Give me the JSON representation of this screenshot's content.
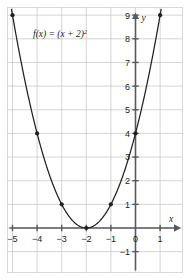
{
  "figure": {
    "background_color": "#ffffff",
    "frame_color": "#d9d9d9",
    "grid_color": "#c9c9c9",
    "axis_color": "#58595b",
    "curve_color": "#231f20",
    "point_color": "#231f20"
  },
  "chart_data": {
    "type": "line",
    "title": "",
    "subtitle": "",
    "xlabel": "x",
    "ylabel": "y",
    "function_label": "f(x) = (x + 2)",
    "function_exponent": "2",
    "equation": "f(x) = (x + 2)^2",
    "xlim": [
      -5.5,
      1.5
    ],
    "ylim": [
      -1.5,
      9.5
    ],
    "xticks": [
      -5,
      -4,
      -3,
      -2,
      -1,
      0,
      1
    ],
    "xtick_labels": [
      "−5",
      "−4",
      "−3",
      "−2",
      "−1",
      "0",
      "1"
    ],
    "yticks": [
      -1,
      1,
      2,
      3,
      4,
      5,
      6,
      7,
      8,
      9
    ],
    "ytick_labels": [
      "−1",
      "1",
      "2",
      "3",
      "4",
      "5",
      "6",
      "7",
      "8",
      "9"
    ],
    "grid": true,
    "legend": "none",
    "series": [
      {
        "name": "f(x) = (x + 2)^2",
        "marked_points": [
          {
            "x": -5,
            "y": 9
          },
          {
            "x": -4,
            "y": 4
          },
          {
            "x": -3,
            "y": 1
          },
          {
            "x": -2,
            "y": 0
          },
          {
            "x": -1,
            "y": 1
          },
          {
            "x": 0,
            "y": 4
          },
          {
            "x": 1,
            "y": 9
          }
        ],
        "vertex": {
          "x": -2,
          "y": 0
        },
        "y_intercept": {
          "x": 0,
          "y": 4
        }
      }
    ]
  }
}
